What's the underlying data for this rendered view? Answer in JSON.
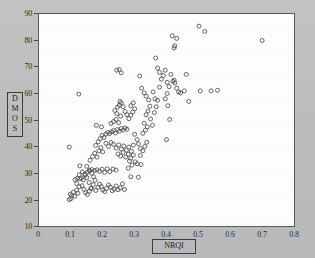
{
  "figure": {
    "background_color": "#bfbfbf",
    "plot_background_color": "#fdfdfd",
    "axis_color": "#5a5a5a",
    "marker_color": "#555555"
  },
  "axes": {
    "ylabel_letters": [
      "D",
      "M",
      "O",
      "S"
    ],
    "ylabel": "DMOS",
    "xlabel": "NRQI",
    "y_ticks": [
      "90",
      "80",
      "70",
      "60",
      "50",
      "40",
      "30",
      "20",
      "10"
    ],
    "x_ticks": [
      "0",
      "0.1",
      "0.2",
      "0.3",
      "0.4",
      "0.5",
      "0.6",
      "0.7",
      "0.8"
    ]
  },
  "chart_data": {
    "type": "scatter",
    "title": "",
    "xlabel": "NRQI",
    "ylabel": "DMOS",
    "xlim": [
      0,
      0.8
    ],
    "ylim": [
      10,
      90
    ],
    "xticks": [
      0,
      0.1,
      0.2,
      0.3,
      0.4,
      0.5,
      0.6,
      0.7,
      0.8
    ],
    "yticks": [
      10,
      20,
      30,
      40,
      50,
      60,
      70,
      80,
      90
    ],
    "grid": false,
    "legend": null,
    "marker": "open-circle",
    "marker_size": 4,
    "series": [
      {
        "name": "images",
        "points": [
          [
            0.095,
            20.0
          ],
          [
            0.1,
            20.3
          ],
          [
            0.103,
            21.5
          ],
          [
            0.098,
            22.0
          ],
          [
            0.108,
            22.8
          ],
          [
            0.112,
            21.2
          ],
          [
            0.118,
            23.5
          ],
          [
            0.122,
            22.4
          ],
          [
            0.126,
            24.8
          ],
          [
            0.118,
            26.0
          ],
          [
            0.113,
            27.5
          ],
          [
            0.128,
            27.8
          ],
          [
            0.135,
            25.2
          ],
          [
            0.141,
            23.8
          ],
          [
            0.146,
            22.6
          ],
          [
            0.152,
            21.9
          ],
          [
            0.158,
            23.1
          ],
          [
            0.163,
            24.3
          ],
          [
            0.157,
            26.4
          ],
          [
            0.15,
            28.3
          ],
          [
            0.144,
            29.6
          ],
          [
            0.152,
            30.3
          ],
          [
            0.159,
            30.8
          ],
          [
            0.166,
            29.9
          ],
          [
            0.171,
            28.6
          ],
          [
            0.176,
            27.2
          ],
          [
            0.17,
            25.6
          ],
          [
            0.164,
            24.1
          ],
          [
            0.178,
            23.4
          ],
          [
            0.185,
            24.6
          ],
          [
            0.19,
            25.8
          ],
          [
            0.196,
            24.9
          ],
          [
            0.2,
            23.6
          ],
          [
            0.206,
            23.0
          ],
          [
            0.212,
            24.2
          ],
          [
            0.218,
            25.5
          ],
          [
            0.224,
            24.7
          ],
          [
            0.23,
            23.3
          ],
          [
            0.236,
            23.9
          ],
          [
            0.242,
            25.1
          ],
          [
            0.248,
            23.7
          ],
          [
            0.255,
            24.4
          ],
          [
            0.262,
            25.9
          ],
          [
            0.268,
            23.8
          ],
          [
            0.15,
            32.5
          ],
          [
            0.158,
            31.0
          ],
          [
            0.166,
            31.3
          ],
          [
            0.174,
            30.9
          ],
          [
            0.182,
            31.2
          ],
          [
            0.19,
            30.6
          ],
          [
            0.198,
            31.4
          ],
          [
            0.206,
            30.2
          ],
          [
            0.214,
            31.6
          ],
          [
            0.222,
            30.5
          ],
          [
            0.232,
            31.5
          ],
          [
            0.242,
            31.1
          ],
          [
            0.128,
            32.7
          ],
          [
            0.136,
            30.4
          ],
          [
            0.145,
            29.2
          ],
          [
            0.139,
            27.4
          ],
          [
            0.133,
            28.1
          ],
          [
            0.126,
            29.3
          ],
          [
            0.12,
            28.0
          ],
          [
            0.16,
            34.8
          ],
          [
            0.168,
            36.2
          ],
          [
            0.175,
            37.5
          ],
          [
            0.182,
            36.0
          ],
          [
            0.188,
            38.3
          ],
          [
            0.194,
            39.6
          ],
          [
            0.2,
            38.0
          ],
          [
            0.178,
            40.4
          ],
          [
            0.186,
            41.8
          ],
          [
            0.192,
            43.0
          ],
          [
            0.198,
            44.2
          ],
          [
            0.204,
            43.4
          ],
          [
            0.21,
            44.7
          ],
          [
            0.216,
            45.3
          ],
          [
            0.222,
            44.9
          ],
          [
            0.228,
            45.6
          ],
          [
            0.234,
            46.0
          ],
          [
            0.24,
            45.1
          ],
          [
            0.246,
            46.4
          ],
          [
            0.252,
            45.8
          ],
          [
            0.258,
            46.8
          ],
          [
            0.264,
            46.2
          ],
          [
            0.27,
            47.0
          ],
          [
            0.276,
            46.5
          ],
          [
            0.21,
            41.2
          ],
          [
            0.218,
            40.0
          ],
          [
            0.226,
            41.5
          ],
          [
            0.234,
            40.8
          ],
          [
            0.242,
            39.4
          ],
          [
            0.25,
            40.6
          ],
          [
            0.258,
            39.0
          ],
          [
            0.266,
            40.2
          ],
          [
            0.274,
            38.6
          ],
          [
            0.282,
            39.8
          ],
          [
            0.29,
            38.2
          ],
          [
            0.296,
            40.5
          ],
          [
            0.248,
            37.2
          ],
          [
            0.256,
            36.4
          ],
          [
            0.264,
            37.8
          ],
          [
            0.272,
            36.0
          ],
          [
            0.28,
            37.1
          ],
          [
            0.288,
            35.6
          ],
          [
            0.296,
            36.8
          ],
          [
            0.302,
            34.2
          ],
          [
            0.308,
            33.5
          ],
          [
            0.292,
            33.0
          ],
          [
            0.284,
            34.5
          ],
          [
            0.226,
            48.7
          ],
          [
            0.234,
            49.4
          ],
          [
            0.242,
            50.2
          ],
          [
            0.25,
            49.0
          ],
          [
            0.256,
            51.5
          ],
          [
            0.244,
            52.4
          ],
          [
            0.238,
            53.6
          ],
          [
            0.246,
            54.8
          ],
          [
            0.252,
            55.6
          ],
          [
            0.258,
            56.4
          ],
          [
            0.264,
            55.0
          ],
          [
            0.254,
            57.0
          ],
          [
            0.27,
            53.2
          ],
          [
            0.276,
            52.0
          ],
          [
            0.282,
            50.5
          ],
          [
            0.288,
            51.8
          ],
          [
            0.294,
            53.0
          ],
          [
            0.3,
            54.2
          ],
          [
            0.296,
            56.5
          ],
          [
            0.288,
            55.4
          ],
          [
            0.244,
            68.8
          ],
          [
            0.252,
            69.0
          ],
          [
            0.258,
            67.8
          ],
          [
            0.125,
            59.8
          ],
          [
            0.18,
            48.0
          ],
          [
            0.196,
            47.4
          ],
          [
            0.095,
            39.8
          ],
          [
            0.3,
            44.6
          ],
          [
            0.308,
            42.6
          ],
          [
            0.312,
            41.0
          ],
          [
            0.318,
            39.2
          ],
          [
            0.32,
            33.2
          ],
          [
            0.312,
            28.4
          ],
          [
            0.288,
            28.6
          ],
          [
            0.28,
            31.8
          ],
          [
            0.318,
            36.6
          ],
          [
            0.326,
            38.4
          ],
          [
            0.332,
            40.0
          ],
          [
            0.338,
            41.6
          ],
          [
            0.326,
            45.0
          ],
          [
            0.334,
            46.2
          ],
          [
            0.34,
            47.4
          ],
          [
            0.33,
            48.8
          ],
          [
            0.336,
            52.0
          ],
          [
            0.342,
            53.4
          ],
          [
            0.348,
            55.2
          ],
          [
            0.344,
            57.6
          ],
          [
            0.336,
            59.0
          ],
          [
            0.33,
            60.2
          ],
          [
            0.322,
            62.0
          ],
          [
            0.316,
            66.6
          ],
          [
            0.35,
            50.4
          ],
          [
            0.356,
            48.0
          ],
          [
            0.362,
            52.8
          ],
          [
            0.368,
            55.0
          ],
          [
            0.364,
            58.0
          ],
          [
            0.358,
            60.6
          ],
          [
            0.372,
            57.4
          ],
          [
            0.378,
            62.4
          ],
          [
            0.384,
            65.4
          ],
          [
            0.378,
            68.0
          ],
          [
            0.372,
            69.6
          ],
          [
            0.366,
            73.4
          ],
          [
            0.39,
            66.8
          ],
          [
            0.396,
            68.8
          ],
          [
            0.402,
            64.2
          ],
          [
            0.408,
            62.6
          ],
          [
            0.402,
            60.0
          ],
          [
            0.396,
            58.0
          ],
          [
            0.404,
            55.4
          ],
          [
            0.41,
            50.2
          ],
          [
            0.4,
            42.6
          ],
          [
            0.414,
            67.2
          ],
          [
            0.42,
            64.6
          ],
          [
            0.426,
            64.0
          ],
          [
            0.424,
            65.0
          ],
          [
            0.432,
            62.0
          ],
          [
            0.438,
            60.6
          ],
          [
            0.444,
            60.2
          ],
          [
            0.418,
            81.8
          ],
          [
            0.432,
            80.8
          ],
          [
            0.426,
            78.0
          ],
          [
            0.424,
            77.2
          ],
          [
            0.462,
            67.2
          ],
          [
            0.456,
            61.0
          ],
          [
            0.47,
            57.0
          ],
          [
            0.506,
            61.0
          ],
          [
            0.54,
            61.0
          ],
          [
            0.56,
            61.2
          ],
          [
            0.502,
            85.4
          ],
          [
            0.52,
            83.4
          ],
          [
            0.7,
            80.0
          ]
        ]
      }
    ]
  }
}
